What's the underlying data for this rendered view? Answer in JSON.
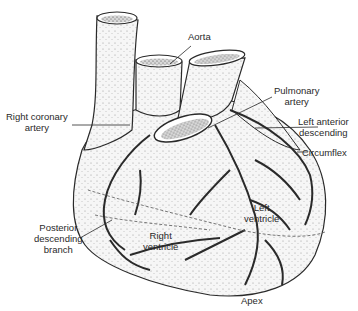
{
  "diagram": {
    "labels": {
      "aorta": "Aorta",
      "pulmonary_artery_1": "Pulmonary",
      "pulmonary_artery_2": "artery",
      "right_coronary_1": "Right coronary",
      "right_coronary_2": "artery",
      "lad_1": "Left anterior",
      "lad_2": "descending",
      "circumflex": "Circumflex",
      "left_ventricle_1": "Left",
      "left_ventricle_2": "ventricle",
      "posterior_1": "Posterior",
      "posterior_2": "descending",
      "posterior_3": "branch",
      "right_ventricle_1": "Right",
      "right_ventricle_2": "ventricle",
      "apex": "Apex"
    },
    "colors": {
      "ink": "#2a2a2a",
      "fill": "#f4f4f4",
      "background": "#ffffff"
    }
  }
}
